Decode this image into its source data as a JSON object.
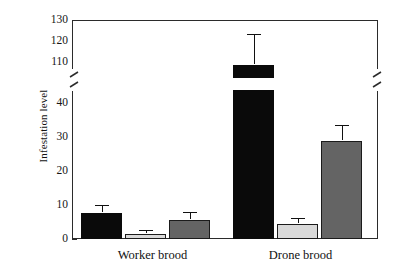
{
  "chart_data": {
    "type": "bar",
    "title": "",
    "subtitle": "",
    "xlabel": "",
    "ylabel": "Infestation level",
    "categories": [
      "Worker brood",
      "Drone brood"
    ],
    "series": [
      {
        "name": "series-1",
        "color": "#0a0a0a",
        "style": "black",
        "values": [
          7.6,
          113.0
        ],
        "errors": [
          2.2,
          14.0
        ]
      },
      {
        "name": "series-2",
        "color": "#d9d9d9",
        "style": "light-gray",
        "values": [
          1.5,
          4.4
        ],
        "errors": [
          0.9,
          1.6
        ]
      },
      {
        "name": "series-3",
        "color": "#646464",
        "style": "dark-gray",
        "values": [
          5.6,
          28.8
        ],
        "errors": [
          2.0,
          4.4
        ]
      }
    ],
    "yticks_lower": [
      0,
      10,
      20,
      30,
      40
    ],
    "yticks_upper": [
      110,
      120,
      130
    ],
    "ylim_lower": [
      0,
      40
    ],
    "ylim_upper": [
      110,
      130
    ],
    "axis_break": true,
    "axis_break_between": [
      40,
      110
    ],
    "grid": false,
    "legend": "none",
    "frame": "box"
  },
  "axis": {
    "y_title": "Infestation level",
    "ticks": [
      {
        "value": "130"
      },
      {
        "value": "120"
      },
      {
        "value": "110"
      },
      {
        "value": "40"
      },
      {
        "value": "30"
      },
      {
        "value": "20"
      },
      {
        "value": "10"
      },
      {
        "value": "0"
      }
    ]
  },
  "groups": [
    {
      "label": "Worker brood"
    },
    {
      "label": "Drone brood"
    }
  ]
}
